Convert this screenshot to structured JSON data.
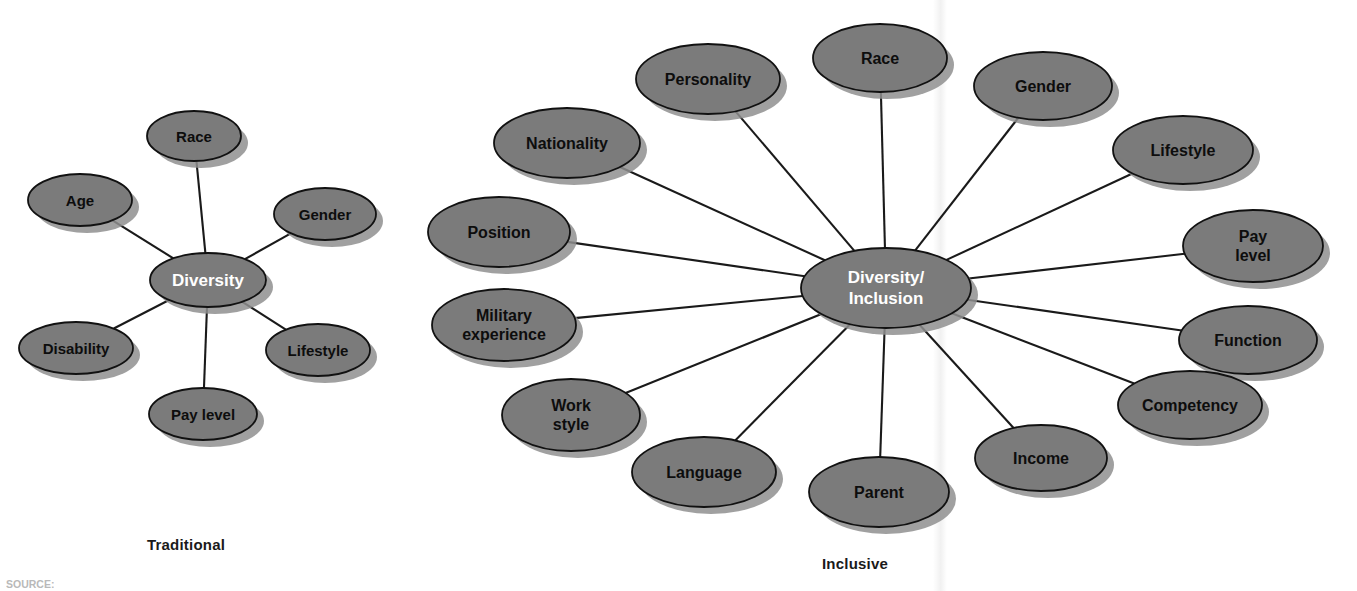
{
  "page": {
    "background_color": "#ffffff",
    "width": 1357,
    "height": 591
  },
  "style": {
    "node_fill": "#7b7b7b",
    "node_stroke": "#111111",
    "node_shadow": "#8f8f8f",
    "connector_color": "#1a1a1a",
    "label_color": "#0d0d0d",
    "center_label_color": "#ffffff"
  },
  "captions": {
    "traditional": "Traditional",
    "inclusive": "Inclusive"
  },
  "source_note": "SOURCE:",
  "chart_data": {
    "type": "diagram",
    "diagram_style": "hub-and-spoke (radial node map)",
    "diagrams": [
      {
        "name": "traditional",
        "caption": "Traditional",
        "center": {
          "label": "Diversity",
          "cx": 208,
          "cy": 280,
          "rx": 58,
          "ry": 27,
          "font_size": 17,
          "text_color": "#ffffff"
        },
        "nodes": [
          {
            "label": "Race",
            "cx": 194,
            "cy": 136,
            "rx": 47,
            "ry": 25,
            "font_size": 15
          },
          {
            "label": "Gender",
            "cx": 325,
            "cy": 214,
            "rx": 51,
            "ry": 26,
            "font_size": 15
          },
          {
            "label": "Lifestyle",
            "cx": 318,
            "cy": 350,
            "rx": 52,
            "ry": 26,
            "font_size": 15
          },
          {
            "label": "Pay level",
            "cx": 203,
            "cy": 414,
            "rx": 54,
            "ry": 26,
            "font_size": 15
          },
          {
            "label": "Disability",
            "cx": 76,
            "cy": 348,
            "rx": 57,
            "ry": 26,
            "font_size": 15
          },
          {
            "label": "Age",
            "cx": 80,
            "cy": 200,
            "rx": 52,
            "ry": 26,
            "font_size": 15
          }
        ],
        "edges": [
          "Diversity-Race",
          "Diversity-Gender",
          "Diversity-Lifestyle",
          "Diversity-Pay level",
          "Diversity-Disability",
          "Diversity-Age"
        ]
      },
      {
        "name": "inclusive",
        "caption": "Inclusive",
        "center": {
          "label_line1": "Diversity/",
          "label_line2": "Inclusion",
          "cx": 886,
          "cy": 288,
          "rx": 85,
          "ry": 40,
          "font_size": 17,
          "text_color": "#ffffff"
        },
        "nodes": [
          {
            "label": "Race",
            "cx": 880,
            "cy": 58,
            "rx": 67,
            "ry": 34,
            "font_size": 16
          },
          {
            "label": "Gender",
            "cx": 1043,
            "cy": 86,
            "rx": 69,
            "ry": 34,
            "font_size": 16
          },
          {
            "label": "Lifestyle",
            "cx": 1183,
            "cy": 150,
            "rx": 70,
            "ry": 34,
            "font_size": 16
          },
          {
            "label_line1": "Pay",
            "label_line2": "level",
            "cx": 1253,
            "cy": 246,
            "rx": 70,
            "ry": 36,
            "font_size": 16
          },
          {
            "label": "Function",
            "cx": 1248,
            "cy": 340,
            "rx": 69,
            "ry": 34,
            "font_size": 16
          },
          {
            "label": "Competency",
            "cx": 1190,
            "cy": 405,
            "rx": 72,
            "ry": 34,
            "font_size": 16
          },
          {
            "label": "Income",
            "cx": 1041,
            "cy": 458,
            "rx": 66,
            "ry": 33,
            "font_size": 16
          },
          {
            "label": "Parent",
            "cx": 879,
            "cy": 492,
            "rx": 70,
            "ry": 35,
            "font_size": 16
          },
          {
            "label": "Language",
            "cx": 704,
            "cy": 472,
            "rx": 72,
            "ry": 35,
            "font_size": 16
          },
          {
            "label_line1": "Work",
            "label_line2": "style",
            "cx": 571,
            "cy": 415,
            "rx": 69,
            "ry": 36,
            "font_size": 16
          },
          {
            "label_line1": "Military",
            "label_line2": "experience",
            "cx": 504,
            "cy": 325,
            "rx": 72,
            "ry": 36,
            "font_size": 16
          },
          {
            "label": "Position",
            "cx": 499,
            "cy": 232,
            "rx": 71,
            "ry": 35,
            "font_size": 16
          },
          {
            "label": "Nationality",
            "cx": 567,
            "cy": 143,
            "rx": 73,
            "ry": 35,
            "font_size": 16
          },
          {
            "label": "Personality",
            "cx": 708,
            "cy": 79,
            "rx": 72,
            "ry": 35,
            "font_size": 16
          }
        ],
        "node_count_visible": 14,
        "edges": [
          "Diversity/Inclusion-Race",
          "Diversity/Inclusion-Gender",
          "Diversity/Inclusion-Lifestyle",
          "Diversity/Inclusion-Pay level",
          "Diversity/Inclusion-Function",
          "Diversity/Inclusion-Competency",
          "Diversity/Inclusion-Income",
          "Diversity/Inclusion-Parent",
          "Diversity/Inclusion-Language",
          "Diversity/Inclusion-Work style",
          "Diversity/Inclusion-Military experience",
          "Diversity/Inclusion-Position",
          "Diversity/Inclusion-Nationality",
          "Diversity/Inclusion-Personality"
        ]
      }
    ]
  }
}
